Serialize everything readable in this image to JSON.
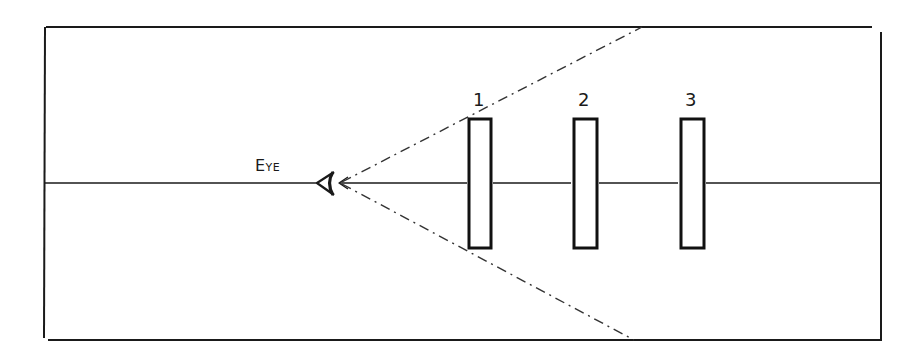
{
  "diagram": {
    "type": "optics-sightline",
    "eye_label": "Eye",
    "screens": [
      {
        "label": "1"
      },
      {
        "label": "2"
      },
      {
        "label": "3"
      }
    ],
    "line_color": "#1a1a1a",
    "background": "#ffffff"
  }
}
